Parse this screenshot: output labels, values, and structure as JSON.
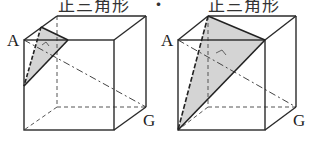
{
  "captions": {
    "left": "正三角形",
    "right": "正三角形",
    "right_prefix": "・"
  },
  "figures": [
    {
      "id": "left-cube",
      "vertex_labels": {
        "A": "A",
        "G": "G"
      },
      "cross_section": "small equilateral triangle near vertex A",
      "fill_color": "#d4d4d4"
    },
    {
      "id": "right-cube",
      "vertex_labels": {
        "A": "A",
        "G": "G"
      },
      "cross_section": "large equilateral triangle through three vertices adjacent to A",
      "fill_color": "#d4d4d4"
    }
  ],
  "colors": {
    "line": "#2a2a2a",
    "hidden_line": "#555555",
    "shade": "#d4d4d4"
  }
}
